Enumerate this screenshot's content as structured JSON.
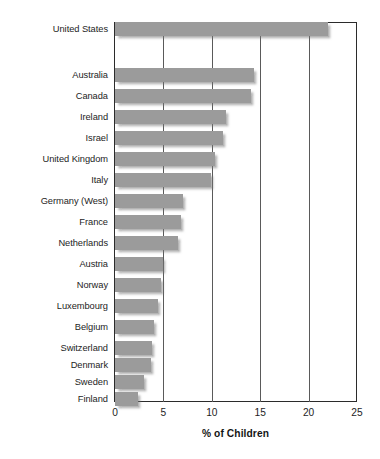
{
  "chart_data": {
    "type": "bar",
    "orientation": "horizontal",
    "title": "",
    "subtitle": "",
    "xlabel": "% of Children",
    "ylabel": "",
    "xlim": [
      0,
      25
    ],
    "xticks": [
      0,
      5,
      10,
      15,
      20,
      25
    ],
    "xtick_labels": [
      "0",
      "5",
      "10",
      "15",
      "20",
      "25"
    ],
    "grid": "vertical",
    "legend": "none",
    "bar_color": "#9b9b9b",
    "frame_color": "#2b2b2b",
    "categories": [
      "United States",
      "Australia",
      "Canada",
      "Ireland",
      "Israel",
      "United Kingdom",
      "Italy",
      "Germany (West)",
      "France",
      "Netherlands",
      "Austria",
      "Norway",
      "Luxembourg",
      "Belgium",
      "Switzerland",
      "Denmark",
      "Sweden",
      "Finland"
    ],
    "values": [
      22.0,
      14.4,
      14.1,
      11.5,
      11.2,
      10.3,
      9.9,
      7.0,
      6.8,
      6.5,
      5.0,
      4.8,
      4.4,
      4.0,
      3.8,
      3.7,
      3.0,
      2.4
    ],
    "bars": [
      {
        "label": "United States",
        "value": 22.0,
        "y": 22
      },
      {
        "label": "Australia",
        "value": 14.4,
        "y": 68
      },
      {
        "label": "Canada",
        "value": 14.1,
        "y": 89
      },
      {
        "label": "Ireland",
        "value": 11.5,
        "y": 110
      },
      {
        "label": "Israel",
        "value": 11.2,
        "y": 131
      },
      {
        "label": "United Kingdom",
        "value": 10.3,
        "y": 152
      },
      {
        "label": "Italy",
        "value": 9.9,
        "y": 173
      },
      {
        "label": "Germany (West)",
        "value": 7.0,
        "y": 194
      },
      {
        "label": "France",
        "value": 6.8,
        "y": 215
      },
      {
        "label": "Netherlands",
        "value": 6.5,
        "y": 236
      },
      {
        "label": "Austria",
        "value": 5.0,
        "y": 257
      },
      {
        "label": "Norway",
        "value": 4.8,
        "y": 278
      },
      {
        "label": "Luxembourg",
        "value": 4.4,
        "y": 299
      },
      {
        "label": "Belgium",
        "value": 4.0,
        "y": 320
      },
      {
        "label": "Switzerland",
        "value": 3.8,
        "y": 341
      },
      {
        "label": "Denmark",
        "value": 3.7,
        "y": 358
      },
      {
        "label": "Sweden",
        "value": 3.0,
        "y": 375
      },
      {
        "label": "Finland",
        "value": 2.4,
        "y": 392
      }
    ]
  }
}
